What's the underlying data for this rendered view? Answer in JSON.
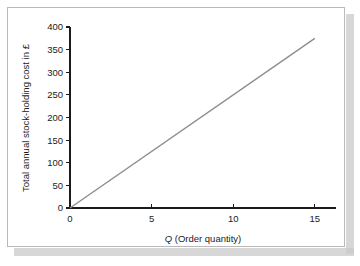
{
  "figure": {
    "card_border_color": "#b9b9b9",
    "background_color": "#ffffff",
    "shadow_color": "#c9c9c9"
  },
  "chart_data": {
    "type": "line",
    "title": "",
    "subtitle": "",
    "xlabel_prefix": "Q",
    "xlabel_suffix": " (Order quantity)",
    "xlabel": "Q (Order quantity)",
    "ylabel": "Total annual stock-holding cost in £",
    "x": [
      0,
      15
    ],
    "series": [
      {
        "name": "Total annual stock-holding cost",
        "color": "#8d8d8d",
        "values": [
          0,
          375
        ]
      }
    ],
    "slope_per_unit": 25,
    "xlim": [
      0,
      16.3
    ],
    "ylim": [
      0,
      400
    ],
    "xticks": [
      0,
      5,
      10,
      15
    ],
    "xtick_labels": [
      "0",
      "5",
      "10",
      "15"
    ],
    "yticks": [
      0,
      50,
      100,
      150,
      200,
      250,
      300,
      350,
      400
    ],
    "ytick_labels": [
      "0",
      "50",
      "100",
      "150",
      "200",
      "250",
      "300",
      "350",
      "400"
    ],
    "grid": false,
    "legend": false,
    "legend_position": "none"
  }
}
